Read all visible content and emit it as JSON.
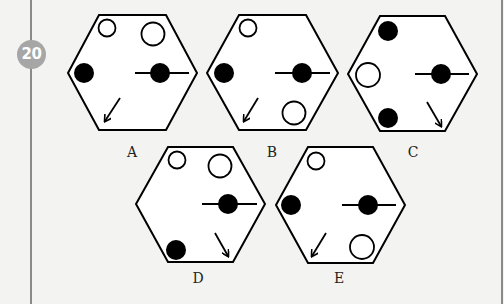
{
  "question": {
    "number": "20",
    "badge_color": "#a6a6a6"
  },
  "options": [
    {
      "label": "A",
      "label_pos": [
        132,
        144
      ],
      "hexagon": [
        [
          99,
          15
        ],
        [
          166,
          15
        ],
        [
          197,
          73
        ],
        [
          166,
          130
        ],
        [
          99,
          130
        ],
        [
          68,
          73
        ]
      ],
      "circles": [
        {
          "cx": 107,
          "cy": 28,
          "r": 8.5,
          "fill": "open"
        },
        {
          "cx": 153,
          "cy": 34,
          "r": 11.5,
          "fill": "open"
        },
        {
          "cx": 84,
          "cy": 73,
          "r": 10,
          "fill": "filled"
        },
        {
          "cx": 160,
          "cy": 73,
          "r": 10,
          "fill": "filled"
        }
      ],
      "line": {
        "x1": 135,
        "y1": 73,
        "x2": 189,
        "y2": 73
      },
      "arrow": {
        "x1": 120,
        "y1": 98,
        "x2": 105,
        "y2": 121,
        "direction": "down-left"
      }
    },
    {
      "label": "B",
      "label_pos": [
        272,
        144
      ],
      "hexagon": [
        [
          239,
          15
        ],
        [
          306,
          15
        ],
        [
          338,
          73
        ],
        [
          306,
          130
        ],
        [
          239,
          130
        ],
        [
          207,
          73
        ]
      ],
      "circles": [
        {
          "cx": 248,
          "cy": 28,
          "r": 8.5,
          "fill": "open"
        },
        {
          "cx": 224,
          "cy": 73,
          "r": 10,
          "fill": "filled"
        },
        {
          "cx": 302,
          "cy": 73,
          "r": 10,
          "fill": "filled"
        },
        {
          "cx": 294,
          "cy": 113,
          "r": 11.5,
          "fill": "open"
        }
      ],
      "line": {
        "x1": 275,
        "y1": 73,
        "x2": 330,
        "y2": 73
      },
      "arrow": {
        "x1": 258,
        "y1": 98,
        "x2": 244,
        "y2": 121,
        "direction": "down-left"
      }
    },
    {
      "label": "C",
      "label_pos": [
        413,
        144
      ],
      "hexagon": [
        [
          380,
          16
        ],
        [
          445,
          16
        ],
        [
          477,
          74
        ],
        [
          445,
          131
        ],
        [
          380,
          131
        ],
        [
          348,
          74
        ]
      ],
      "circles": [
        {
          "cx": 388,
          "cy": 31,
          "r": 10,
          "fill": "filled"
        },
        {
          "cx": 368,
          "cy": 75,
          "r": 12,
          "fill": "open"
        },
        {
          "cx": 388,
          "cy": 118,
          "r": 10,
          "fill": "filled"
        },
        {
          "cx": 441,
          "cy": 74,
          "r": 10,
          "fill": "filled"
        }
      ],
      "line": {
        "x1": 415,
        "y1": 74,
        "x2": 469,
        "y2": 74
      },
      "arrow": {
        "x1": 427,
        "y1": 102,
        "x2": 441,
        "y2": 126,
        "direction": "down-right"
      }
    },
    {
      "label": "D",
      "label_pos": [
        198,
        270
      ],
      "hexagon": [
        [
          168,
          147
        ],
        [
          233,
          147
        ],
        [
          265,
          204
        ],
        [
          233,
          262
        ],
        [
          168,
          262
        ],
        [
          136,
          204
        ]
      ],
      "circles": [
        {
          "cx": 177,
          "cy": 160,
          "r": 8.5,
          "fill": "open"
        },
        {
          "cx": 220,
          "cy": 166,
          "r": 11.5,
          "fill": "open"
        },
        {
          "cx": 228,
          "cy": 204,
          "r": 10,
          "fill": "filled"
        },
        {
          "cx": 176,
          "cy": 250,
          "r": 10,
          "fill": "filled"
        }
      ],
      "line": {
        "x1": 202,
        "y1": 204,
        "x2": 257,
        "y2": 204
      },
      "arrow": {
        "x1": 215,
        "y1": 233,
        "x2": 228,
        "y2": 256,
        "direction": "down-right"
      }
    },
    {
      "label": "E",
      "label_pos": [
        339,
        270
      ],
      "hexagon": [
        [
          308,
          147
        ],
        [
          373,
          147
        ],
        [
          405,
          205
        ],
        [
          373,
          263
        ],
        [
          308,
          263
        ],
        [
          276,
          205
        ]
      ],
      "circles": [
        {
          "cx": 316,
          "cy": 161,
          "r": 8.5,
          "fill": "open"
        },
        {
          "cx": 291,
          "cy": 205,
          "r": 10,
          "fill": "filled"
        },
        {
          "cx": 368,
          "cy": 205,
          "r": 10,
          "fill": "filled"
        },
        {
          "cx": 362,
          "cy": 247,
          "r": 12,
          "fill": "open"
        }
      ],
      "line": {
        "x1": 342,
        "y1": 205,
        "x2": 396,
        "y2": 205
      },
      "arrow": {
        "x1": 326,
        "y1": 233,
        "x2": 312,
        "y2": 256,
        "direction": "down-left"
      }
    }
  ]
}
